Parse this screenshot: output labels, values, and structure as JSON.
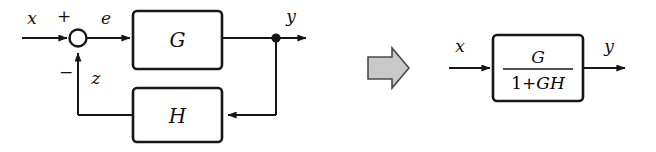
{
  "figure": {
    "background_color": "#ffffff",
    "line_color": "#161616"
  },
  "left_diagram": {
    "name": "closed-loop-feedback-system",
    "input_label": "x",
    "error_label": "e",
    "feedback_label": "z",
    "output_label": "y",
    "sum_plus_sign": "+",
    "sum_minus_sign": "−",
    "forward_block_label": "G",
    "feedback_block_label": "H"
  },
  "transition": {
    "arrow_icon": "block-arrow-right-icon",
    "arrow_fill": "#c9c9c9",
    "arrow_stroke": "#4a4a4a"
  },
  "right_diagram": {
    "name": "equivalent-transfer-function",
    "input_label": "x",
    "output_label": "y",
    "transfer_numerator": "G",
    "transfer_denominator_upright": "1+",
    "transfer_denominator_italic": "GH",
    "transfer_function_text": "G / (1+GH)"
  }
}
